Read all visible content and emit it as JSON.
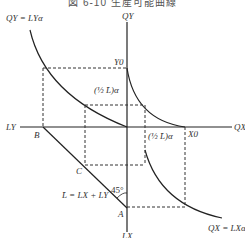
{
  "title": "図 6-10 生産可能曲線",
  "labels": {
    "qy_curve": "QY = LYα",
    "qy_axis": "QY",
    "y0": "Y0",
    "half_l_upper": "(½ L̄)α",
    "half_l_lower": "(½ L̄)α",
    "x0": "X0",
    "qx_axis": "QX",
    "ly_axis": "LY",
    "lx_axis": "LX",
    "point_b": "B",
    "point_c": "C",
    "point_a": "A",
    "angle": "45°",
    "constraint": "L̄ = LX + LY",
    "qx_curve": "QX = LXα"
  },
  "colors": {
    "line": "#222222",
    "dash": "#333333",
    "text": "#333333"
  }
}
